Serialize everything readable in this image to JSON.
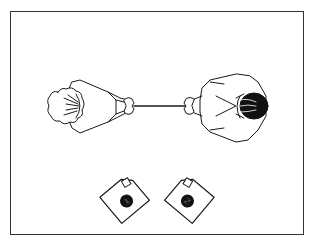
{
  "diagram": {
    "colors": {
      "line": "#1a1a1a",
      "background": "#ffffff",
      "frame": "#333333",
      "hair_dark": "#111111"
    },
    "figures": [
      {
        "id": "person-left",
        "hair": "light",
        "facing": "right"
      },
      {
        "id": "person-right",
        "hair": "dark",
        "facing": "left"
      }
    ],
    "connector": "rope",
    "cards": [
      {
        "id": "card-1",
        "label": "1"
      },
      {
        "id": "card-2",
        "label": "2"
      }
    ]
  }
}
